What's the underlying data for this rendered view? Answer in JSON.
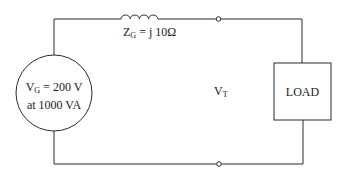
{
  "diagram": {
    "type": "circuit",
    "source": {
      "label_symbol": "V",
      "label_subscript": "G",
      "label_value": "= 200 V",
      "line2": "at 1000 VA"
    },
    "impedance": {
      "label_symbol": "Z",
      "label_subscript": "G",
      "label_value": "= j 10Ω",
      "component": "inductor"
    },
    "terminal_voltage": {
      "label_symbol": "V",
      "label_subscript": "T"
    },
    "load": {
      "label": "LOAD"
    },
    "terminals": [
      {
        "position": "top"
      },
      {
        "position": "bottom"
      }
    ],
    "colors": {
      "wire": "#2a2a2a",
      "background": "#ffffff"
    }
  }
}
